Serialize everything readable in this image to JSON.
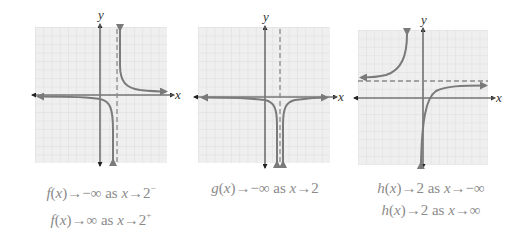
{
  "colors": {
    "grid_bg": "#efefef",
    "grid_line": "#d4d4d4",
    "axis": "#777777",
    "curve": "#7a7a7a",
    "asymptote": "#8a8a8a",
    "caption": "#8a8a8a"
  },
  "graphs": [
    {
      "name": "f",
      "x_axis_label": "x",
      "y_axis_label": "y",
      "asymptotes": [
        {
          "type": "vertical",
          "x": 2
        }
      ],
      "captions": [
        {
          "fn": "f",
          "arg": "x",
          "arrow": "→",
          "target": "−∞",
          "as": "as",
          "var": "x",
          "approach": "2",
          "side": "−"
        },
        {
          "fn": "f",
          "arg": "x",
          "arrow": "→",
          "target": "∞",
          "as": "as",
          "var": "x",
          "approach": "2",
          "side": "+"
        }
      ]
    },
    {
      "name": "g",
      "x_axis_label": "x",
      "y_axis_label": "y",
      "asymptotes": [
        {
          "type": "vertical",
          "x": 2
        }
      ],
      "captions": [
        {
          "fn": "g",
          "arg": "x",
          "arrow": "→",
          "target": "−∞",
          "as": "as",
          "var": "x",
          "approach": "2",
          "side": ""
        }
      ]
    },
    {
      "name": "h",
      "x_axis_label": "x",
      "y_axis_label": "y",
      "asymptotes": [
        {
          "type": "horizontal",
          "y": 2
        }
      ],
      "captions": [
        {
          "fn": "h",
          "arg": "x",
          "arrow": "→",
          "target": "2",
          "as": "as",
          "var": "x",
          "approach": "−∞",
          "side": ""
        },
        {
          "fn": "h",
          "arg": "x",
          "arrow": "→",
          "target": "2",
          "as": "as",
          "var": "x",
          "approach": "∞",
          "side": ""
        }
      ]
    }
  ]
}
